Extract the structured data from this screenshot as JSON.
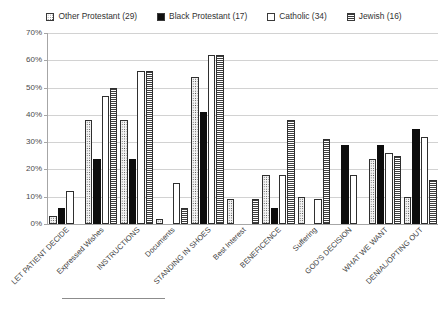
{
  "chart_data": {
    "type": "bar",
    "title": "",
    "xlabel": "",
    "ylabel": "",
    "ylim": [
      0,
      70
    ],
    "ytick_labels": [
      "0%",
      "10%",
      "20%",
      "30%",
      "40%",
      "50%",
      "60%",
      "70%"
    ],
    "ytick_values": [
      0,
      10,
      20,
      30,
      40,
      50,
      60,
      70
    ],
    "grid": true,
    "legend_position": "top",
    "categories": [
      "LET PATIENT DECIDE",
      "Expressed Wishes",
      "INSTRUCTIONS",
      "Documents",
      "STANDING IN SHOES",
      "Best Interest",
      "BENEFICENCE",
      "Suffering",
      "GOD'S DECISION",
      "WHAT WE WANT",
      "DENIAL/OPTING OUT"
    ],
    "series": [
      {
        "name": "Other Protestant (29)",
        "n": 29,
        "fill": "dots",
        "values": [
          3,
          38,
          38,
          2,
          54,
          9,
          18,
          10,
          0,
          24,
          10
        ]
      },
      {
        "name": "Black Protestant (17)",
        "n": 17,
        "fill": "solid",
        "values": [
          6,
          24,
          24,
          0,
          41,
          0,
          6,
          0,
          29,
          29,
          35
        ]
      },
      {
        "name": "Catholic (34)",
        "n": 34,
        "fill": "open",
        "values": [
          12,
          47,
          56,
          15,
          62,
          0,
          18,
          9,
          18,
          26,
          32
        ]
      },
      {
        "name": "Jewish (16)",
        "n": 16,
        "fill": "hlines",
        "values": [
          0,
          50,
          56,
          6,
          62,
          9,
          38,
          31,
          0,
          25,
          16
        ]
      }
    ]
  },
  "legend": {
    "items": [
      {
        "label": "Other Protestant (29)",
        "swatch": "dots-swatch-icon"
      },
      {
        "label": "Black Protestant (17)",
        "swatch": "solid-swatch-icon"
      },
      {
        "label": "Catholic (34)",
        "swatch": "open-swatch-icon"
      },
      {
        "label": "Jewish (16)",
        "swatch": "hlines-swatch-icon"
      }
    ]
  },
  "colors": {
    "axis": "#a6a6a6",
    "grid": "#d2d2d2",
    "text": "#3f3f3f",
    "solid_bar": "#0d0d0d",
    "pattern_ink": "#3f3f3f",
    "background": "#ffffff"
  }
}
